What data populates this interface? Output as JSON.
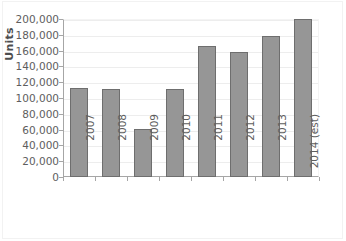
{
  "chart_data": {
    "type": "bar",
    "title": "",
    "xlabel": "",
    "ylabel": "Units",
    "categories": [
      "2007",
      "2008",
      "2009",
      "2010",
      "2011",
      "2012",
      "2013",
      "2014 (est)"
    ],
    "values": [
      113000,
      112000,
      61000,
      111500,
      166000,
      158500,
      179000,
      200000
    ],
    "ylim": [
      0,
      200000
    ],
    "ytick_step": 20000,
    "ytick_labels": [
      "200,000",
      "180,000",
      "160,000",
      "140,000",
      "120,000",
      "100,000",
      "80,000",
      "60,000",
      "40,000",
      "20,000",
      "0"
    ],
    "ytick_values": [
      200000,
      180000,
      160000,
      140000,
      120000,
      100000,
      80000,
      60000,
      40000,
      20000,
      0
    ],
    "grid": true,
    "legend": "none",
    "series": [
      {
        "name": "Units",
        "values": [
          113000,
          112000,
          61000,
          111500,
          166000,
          158500,
          179000,
          200000
        ]
      }
    ],
    "colors": {
      "bar_fill": "#969696",
      "bar_border": "#6e6e6e",
      "gridline": "#ededed",
      "axis": "#a6a6a6",
      "text": "#5e5e5e",
      "background": "#ffffff"
    }
  }
}
